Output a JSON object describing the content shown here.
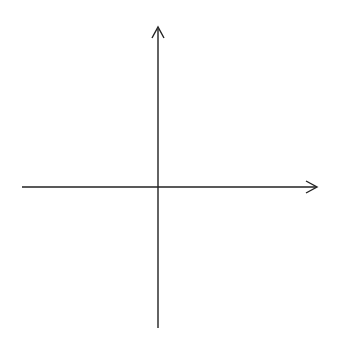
{
  "diagram": {
    "type": "coordinate-plane",
    "axes": {
      "x_label": "x",
      "y_label": "y",
      "x_range": [
        -5,
        5
      ],
      "y_range": [
        -5,
        5
      ]
    },
    "grid": {
      "lines": "dotted",
      "color": "#b0b0b0",
      "cols": 12,
      "rows": 12
    },
    "x_ticks": [
      {
        "value": -5,
        "label": "−5"
      },
      {
        "value": -4,
        "label": "−4"
      },
      {
        "value": -3,
        "label": "−3"
      },
      {
        "value": -2,
        "label": "−2"
      },
      {
        "value": -1,
        "label": "−1"
      },
      {
        "value": 1,
        "label": "1"
      },
      {
        "value": 2,
        "label": "2"
      },
      {
        "value": 3,
        "label": "3"
      },
      {
        "value": 4,
        "label": "4"
      },
      {
        "value": 5,
        "label": "5"
      }
    ],
    "y_ticks": [
      {
        "value": 5,
        "label": "5"
      },
      {
        "value": 4,
        "label": "4"
      },
      {
        "value": 3,
        "label": "3"
      },
      {
        "value": 2,
        "label": "2"
      },
      {
        "value": 1,
        "label": "1"
      },
      {
        "value": -1,
        "label": "−1"
      },
      {
        "value": -2,
        "label": "−2"
      },
      {
        "value": -3,
        "label": "−3"
      },
      {
        "value": -4,
        "label": "−4"
      },
      {
        "value": -5,
        "label": "−5"
      }
    ]
  }
}
